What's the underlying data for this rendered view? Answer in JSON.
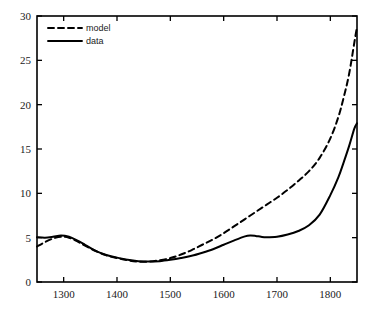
{
  "chart_data": {
    "type": "line",
    "title": "",
    "subtitle": "",
    "xlabel": "",
    "ylabel": "",
    "xlim": [
      1250,
      1850
    ],
    "ylim": [
      0,
      30
    ],
    "grid": false,
    "legend_position": "top-left",
    "x_ticks": [
      1300,
      1400,
      1500,
      1600,
      1700,
      1800
    ],
    "x_tick_labels": [
      "1300",
      "1400",
      "1500",
      "1600",
      "1700",
      "1800"
    ],
    "y_ticks": [
      0,
      5,
      10,
      15,
      20,
      25,
      30
    ],
    "y_tick_labels": [
      "0",
      "5",
      "10",
      "15",
      "20",
      "25",
      "30"
    ],
    "series": [
      {
        "name": "model",
        "style": "dashed",
        "color": "#000000",
        "x": [
          1250,
          1265,
          1280,
          1295,
          1310,
          1325,
          1340,
          1360,
          1380,
          1400,
          1420,
          1440,
          1460,
          1480,
          1500,
          1520,
          1540,
          1560,
          1580,
          1600,
          1620,
          1640,
          1660,
          1680,
          1700,
          1720,
          1740,
          1760,
          1780,
          1800,
          1815,
          1825,
          1835,
          1845,
          1850
        ],
        "y": [
          4.0,
          4.5,
          4.9,
          5.1,
          5.0,
          4.6,
          4.1,
          3.5,
          3.0,
          2.7,
          2.45,
          2.3,
          2.3,
          2.45,
          2.7,
          3.1,
          3.6,
          4.2,
          4.8,
          5.5,
          6.3,
          7.1,
          7.9,
          8.7,
          9.5,
          10.4,
          11.4,
          12.5,
          14.0,
          16.2,
          18.6,
          20.8,
          23.4,
          27.0,
          28.8
        ]
      },
      {
        "name": "data",
        "style": "solid",
        "color": "#000000",
        "x": [
          1250,
          1265,
          1280,
          1295,
          1310,
          1325,
          1340,
          1360,
          1380,
          1400,
          1420,
          1440,
          1460,
          1480,
          1500,
          1520,
          1540,
          1560,
          1580,
          1600,
          1620,
          1640,
          1650,
          1660,
          1670,
          1680,
          1700,
          1720,
          1740,
          1760,
          1780,
          1800,
          1815,
          1825,
          1835,
          1845,
          1850
        ],
        "y": [
          5.05,
          5.0,
          5.1,
          5.25,
          5.1,
          4.7,
          4.2,
          3.5,
          3.05,
          2.75,
          2.5,
          2.35,
          2.3,
          2.35,
          2.5,
          2.7,
          2.95,
          3.3,
          3.7,
          4.2,
          4.7,
          5.15,
          5.25,
          5.2,
          5.1,
          5.05,
          5.1,
          5.35,
          5.75,
          6.4,
          7.6,
          9.8,
          11.8,
          13.5,
          15.3,
          17.3,
          17.9
        ]
      }
    ]
  },
  "legend": {
    "entries": [
      {
        "label": "model",
        "style": "dashed"
      },
      {
        "label": "data",
        "style": "solid"
      }
    ]
  }
}
